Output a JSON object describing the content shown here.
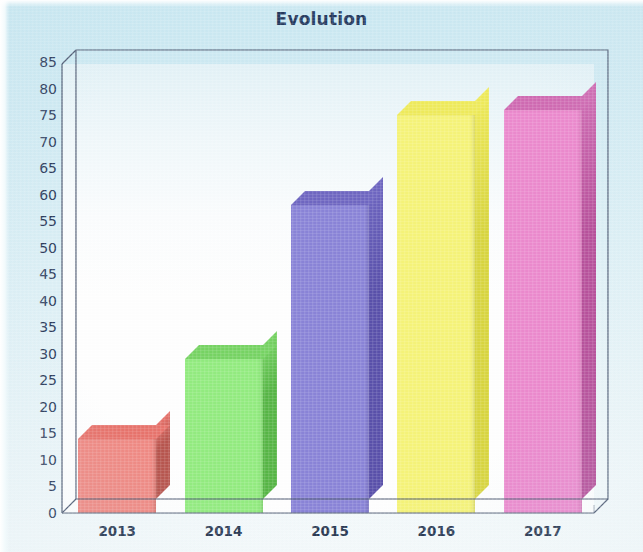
{
  "chart_data": {
    "type": "bar",
    "title": "Evolution",
    "xlabel": "",
    "ylabel": "",
    "categories": [
      "2013",
      "2014",
      "2015",
      "2016",
      "2017"
    ],
    "values": [
      14,
      29,
      58,
      75,
      76
    ],
    "ylim": [
      0,
      85
    ],
    "ytick_step": 5,
    "yticks": [
      "85",
      "80",
      "75",
      "70",
      "65",
      "60",
      "55",
      "50",
      "45",
      "40",
      "35",
      "30",
      "25",
      "20",
      "15",
      "10",
      "5",
      "0"
    ],
    "grid": false,
    "legend": false,
    "legend_position": "none",
    "style": "3d-column",
    "series": [
      {
        "name": "Evolution",
        "values": [
          14,
          29,
          58,
          75,
          76
        ]
      }
    ],
    "bar_colors": [
      "#f08a84",
      "#93ec80",
      "#8a84d8",
      "#f6f479",
      "#ec8ace"
    ],
    "bar_side_colors": [
      "#b8564f",
      "#57b646",
      "#5a51ab",
      "#d9d640",
      "#b8529c"
    ],
    "bar_top_colors": [
      "#e8746d",
      "#77d464",
      "#6f67c2",
      "#efeb5c",
      "#d06bb3"
    ],
    "title_color": "#24395e",
    "axis_color": "#4e5a72",
    "tick_label_color": "#2d3c5c",
    "background_color": "#d6edf4",
    "plot_background_color": "#ffffff"
  }
}
